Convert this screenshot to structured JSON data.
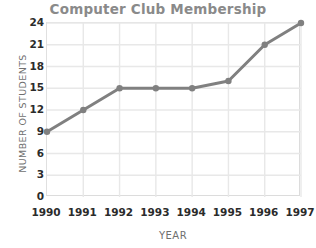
{
  "chart_data": {
    "type": "line",
    "title": "Computer Club Membership",
    "xlabel": "YEAR",
    "ylabel": "NUMBER OF STUDENTS",
    "categories": [
      "1990",
      "1991",
      "1992",
      "1993",
      "1994",
      "1995",
      "1996",
      "1997"
    ],
    "values": [
      9,
      12,
      15,
      15,
      15,
      16,
      21,
      24
    ],
    "series": [
      {
        "name": "Members",
        "values": [
          9,
          12,
          15,
          15,
          15,
          16,
          21,
          24
        ]
      }
    ],
    "yticks": [
      0,
      3,
      6,
      9,
      12,
      15,
      18,
      21,
      24
    ],
    "ylim": [
      0,
      24
    ],
    "xticks": [
      "1990",
      "1991",
      "1992",
      "1993",
      "1994",
      "1995",
      "1996",
      "1997"
    ],
    "grid": true,
    "legend": false,
    "legend_position": "none",
    "colors": {
      "line": "#808080",
      "marker": "#808080",
      "grid": "#e8e8e8",
      "axis": "#dcdcdc",
      "title_text": "#8a8a8a",
      "axis_label_text": "#6f6f6f",
      "tick_text": "#2b2b2b",
      "background": "#ffffff"
    }
  }
}
